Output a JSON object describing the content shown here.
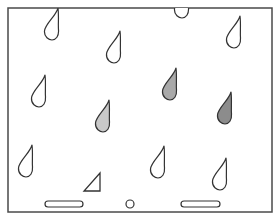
{
  "game": {
    "frame": {
      "x": 8,
      "y": 8,
      "width": 264,
      "height": 204,
      "stroke": "#4a4a4a"
    },
    "raindrops": [
      {
        "id": 1,
        "x": 52,
        "y": 24,
        "fill": "#ffffff"
      },
      {
        "id": 2,
        "x": 114,
        "y": 47,
        "fill": "#ffffff"
      },
      {
        "id": 3,
        "x": 182,
        "y": 2,
        "fill": "#ffffff"
      },
      {
        "id": 4,
        "x": 234,
        "y": 32,
        "fill": "#ffffff"
      },
      {
        "id": 5,
        "x": 39,
        "y": 91,
        "fill": "#ffffff"
      },
      {
        "id": 6,
        "x": 170,
        "y": 84,
        "fill": "#a9a9a9"
      },
      {
        "id": 7,
        "x": 103,
        "y": 116,
        "fill": "#c9c9c9"
      },
      {
        "id": 8,
        "x": 225,
        "y": 108,
        "fill": "#8c8c8c"
      },
      {
        "id": 9,
        "x": 26,
        "y": 161,
        "fill": "#ffffff"
      },
      {
        "id": 10,
        "x": 158,
        "y": 162,
        "fill": "#ffffff"
      },
      {
        "id": 11,
        "x": 220,
        "y": 174,
        "fill": "#ffffff"
      }
    ],
    "triangle": {
      "points": "100,173 100,191 84,191"
    },
    "paddles": [
      {
        "id": "left",
        "x": 45,
        "y": 201,
        "width": 38,
        "height": 6
      },
      {
        "id": "right",
        "x": 181,
        "y": 201,
        "width": 39,
        "height": 6
      }
    ],
    "ball": {
      "cx": 130,
      "cy": 204,
      "r": 4
    },
    "colors": {
      "stroke": "#333333",
      "background": "#ffffff"
    }
  }
}
